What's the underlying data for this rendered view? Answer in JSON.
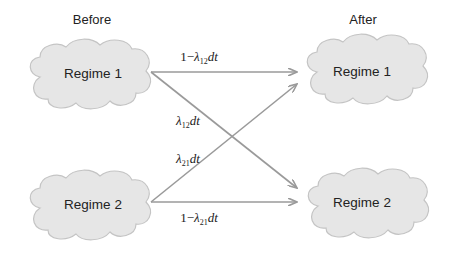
{
  "headers": {
    "before": "Before",
    "after": "After"
  },
  "nodes": {
    "before_regime1": "Regime 1",
    "before_regime2": "Regime 2",
    "after_regime1": "Regime 1",
    "after_regime2": "Regime 2"
  },
  "transitions": [
    {
      "from": "Regime 1",
      "to": "Regime 1",
      "label_prefix": "1−",
      "symbol": "λ",
      "subscript": "12",
      "suffix": "dt"
    },
    {
      "from": "Regime 1",
      "to": "Regime 2",
      "label_prefix": "",
      "symbol": "λ",
      "subscript": "12",
      "suffix": "dt"
    },
    {
      "from": "Regime 2",
      "to": "Regime 1",
      "label_prefix": "",
      "symbol": "λ",
      "subscript": "21",
      "suffix": "dt"
    },
    {
      "from": "Regime 2",
      "to": "Regime 2",
      "label_prefix": "1−",
      "symbol": "λ",
      "subscript": "21",
      "suffix": "dt"
    }
  ],
  "colors": {
    "cloud_fill": "#e6e6e6",
    "cloud_stroke": "#bdbdbd",
    "arrow": "#9a9a9a",
    "text": "#222222"
  }
}
